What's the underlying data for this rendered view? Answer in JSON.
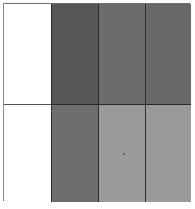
{
  "figure": {
    "background_color": "#ffffff",
    "border_color": "#4a4a4a",
    "divider_color": "#2e2e2e",
    "rows": 2,
    "columns": 4
  },
  "chart_data": {
    "type": "heatmap",
    "subtitle": "",
    "xlabel": "",
    "ylabel": "",
    "grid": true,
    "legend": "none",
    "columns": [
      "1",
      "2",
      "3",
      "4"
    ],
    "rows": [
      "1",
      "2"
    ],
    "colormap": "grayscale",
    "value_range": [
      0,
      255
    ],
    "cells": [
      {
        "row": 1,
        "column": 1,
        "label": "r1c1",
        "color": "#ffffff",
        "gray_value": 255
      },
      {
        "row": 1,
        "column": 2,
        "label": "r1c2",
        "color": "#575757",
        "gray_value": 87
      },
      {
        "row": 1,
        "column": 3,
        "label": "r1c3",
        "color": "#6b6b6b",
        "gray_value": 107
      },
      {
        "row": 1,
        "column": 4,
        "label": "r1c4",
        "color": "#686868",
        "gray_value": 104
      },
      {
        "row": 2,
        "column": 1,
        "label": "r2c1",
        "color": "#ffffff",
        "gray_value": 255
      },
      {
        "row": 2,
        "column": 2,
        "label": "r2c2",
        "color": "#6e6e6e",
        "gray_value": 110
      },
      {
        "row": 2,
        "column": 3,
        "label": "r2c3",
        "color": "#9b9b9b",
        "gray_value": 155
      },
      {
        "row": 2,
        "column": 4,
        "label": "r2c4",
        "color": "#9a9a9a",
        "gray_value": 154
      }
    ],
    "values": [
      [
        255,
        87,
        107,
        104
      ],
      [
        255,
        110,
        155,
        154
      ]
    ]
  }
}
